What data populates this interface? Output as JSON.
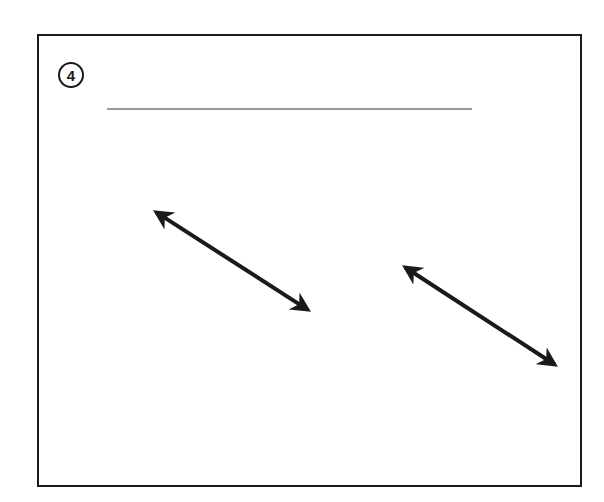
{
  "figure": {
    "step_number": "4",
    "answer_line": {
      "x1": 107,
      "x2": 472,
      "y": 109,
      "color": "#9a9a9a"
    },
    "arrows": [
      {
        "name": "double-arrow-left",
        "x1": 148,
        "y1": 207,
        "x2": 316,
        "y2": 315,
        "color": "#1a1a1a"
      },
      {
        "name": "double-arrow-right",
        "x1": 397,
        "y1": 262,
        "x2": 563,
        "y2": 370,
        "color": "#1a1a1a"
      }
    ],
    "frame_color": "#1a1a1a"
  }
}
